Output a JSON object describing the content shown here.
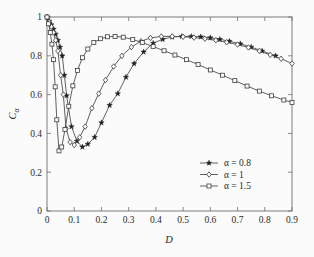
{
  "chart_data": {
    "type": "line",
    "title": "",
    "xlabel": "D",
    "ylabel": "C_alpha",
    "ylabel_base": "C",
    "ylabel_sub": "α",
    "xlim": [
      0,
      0.9
    ],
    "ylim": [
      0,
      1
    ],
    "xticks": [
      0,
      0.1,
      0.2,
      0.3,
      0.4,
      0.5,
      0.6,
      0.7,
      0.8,
      0.9
    ],
    "xticklabels": [
      "0",
      "0.1",
      "0.2",
      "0.3",
      "0.4",
      "0.5",
      "0.6",
      "0.7",
      "0.8",
      "0.9"
    ],
    "yticks": [
      0,
      0.2,
      0.4,
      0.6,
      0.8,
      1
    ],
    "yticklabels": [
      "0",
      "0.2",
      "0.4",
      "0.6",
      "0.8",
      "1"
    ],
    "grid": false,
    "legend_position": "center-right",
    "line_color": "#444444",
    "marker_edge_color": "#333333",
    "series": [
      {
        "name": "α = 0.8",
        "marker": "star-filled",
        "filled": true,
        "x": [
          0.0,
          0.008,
          0.016,
          0.024,
          0.032,
          0.04,
          0.048,
          0.056,
          0.064,
          0.072,
          0.09,
          0.11,
          0.13,
          0.15,
          0.175,
          0.2,
          0.23,
          0.26,
          0.29,
          0.32,
          0.355,
          0.39,
          0.425,
          0.46,
          0.495,
          0.53,
          0.565,
          0.6,
          0.635,
          0.67,
          0.71,
          0.75,
          0.79,
          0.84
        ],
        "y": [
          1.0,
          0.98,
          0.96,
          0.938,
          0.912,
          0.88,
          0.845,
          0.8,
          0.7,
          0.595,
          0.435,
          0.36,
          0.33,
          0.345,
          0.38,
          0.455,
          0.545,
          0.605,
          0.69,
          0.76,
          0.82,
          0.865,
          0.885,
          0.897,
          0.9,
          0.9,
          0.898,
          0.893,
          0.885,
          0.875,
          0.862,
          0.845,
          0.825,
          0.8
        ]
      },
      {
        "name": "α = 1",
        "marker": "diamond-open",
        "filled": false,
        "x": [
          0.0,
          0.008,
          0.016,
          0.024,
          0.032,
          0.04,
          0.05,
          0.06,
          0.07,
          0.085,
          0.1,
          0.12,
          0.14,
          0.165,
          0.19,
          0.215,
          0.245,
          0.275,
          0.31,
          0.345,
          0.38,
          0.42,
          0.46,
          0.5,
          0.54,
          0.58,
          0.62,
          0.66,
          0.7,
          0.74,
          0.78,
          0.82,
          0.86,
          0.9
        ],
        "y": [
          1.0,
          0.975,
          0.95,
          0.92,
          0.88,
          0.825,
          0.7,
          0.6,
          0.425,
          0.355,
          0.34,
          0.38,
          0.435,
          0.53,
          0.605,
          0.675,
          0.745,
          0.8,
          0.845,
          0.875,
          0.892,
          0.9,
          0.9,
          0.898,
          0.894,
          0.888,
          0.88,
          0.87,
          0.858,
          0.843,
          0.825,
          0.805,
          0.785,
          0.76
        ]
      },
      {
        "name": "α = 1.5",
        "marker": "square-open",
        "filled": false,
        "x": [
          0.0,
          0.006,
          0.012,
          0.018,
          0.024,
          0.03,
          0.036,
          0.044,
          0.054,
          0.066,
          0.08,
          0.095,
          0.112,
          0.13,
          0.15,
          0.172,
          0.196,
          0.222,
          0.25,
          0.28,
          0.315,
          0.35,
          0.39,
          0.43,
          0.47,
          0.512,
          0.555,
          0.6,
          0.645,
          0.69,
          0.735,
          0.78,
          0.825,
          0.87,
          0.9
        ],
        "y": [
          1.0,
          0.965,
          0.92,
          0.86,
          0.78,
          0.64,
          0.47,
          0.31,
          0.33,
          0.42,
          0.54,
          0.645,
          0.725,
          0.79,
          0.835,
          0.868,
          0.888,
          0.898,
          0.9,
          0.896,
          0.884,
          0.868,
          0.848,
          0.826,
          0.804,
          0.78,
          0.755,
          0.727,
          0.7,
          0.672,
          0.644,
          0.618,
          0.594,
          0.572,
          0.56
        ]
      }
    ]
  },
  "legend": {
    "entries": [
      {
        "label": "α = 0.8",
        "marker": "star-filled"
      },
      {
        "label": "α = 1",
        "marker": "diamond-open"
      },
      {
        "label": "α = 1.5",
        "marker": "square-open"
      }
    ]
  }
}
